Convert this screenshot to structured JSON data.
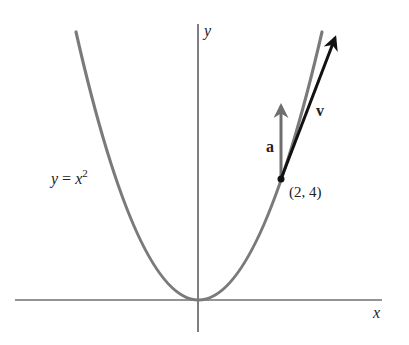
{
  "figure": {
    "curve_label_y": "y",
    "curve_label_eq": " = ",
    "curve_label_x": "x",
    "curve_label_exp": "2",
    "axis_x_label": "x",
    "axis_y_label": "y",
    "point_label": "(2, 4)",
    "velocity_label": "v",
    "acceleration_label": "a"
  },
  "colors": {
    "curve": "#7a7a7a",
    "axes": "#2a2a2a",
    "velocity": "#111111",
    "acceleration": "#6e6e6e",
    "background": "#ffffff"
  },
  "geometry": {
    "function": "y = x^2",
    "point": [
      2,
      4
    ],
    "velocity_vector_direction": "tangent at (2,4)",
    "acceleration_vector_direction": "vertical up"
  }
}
